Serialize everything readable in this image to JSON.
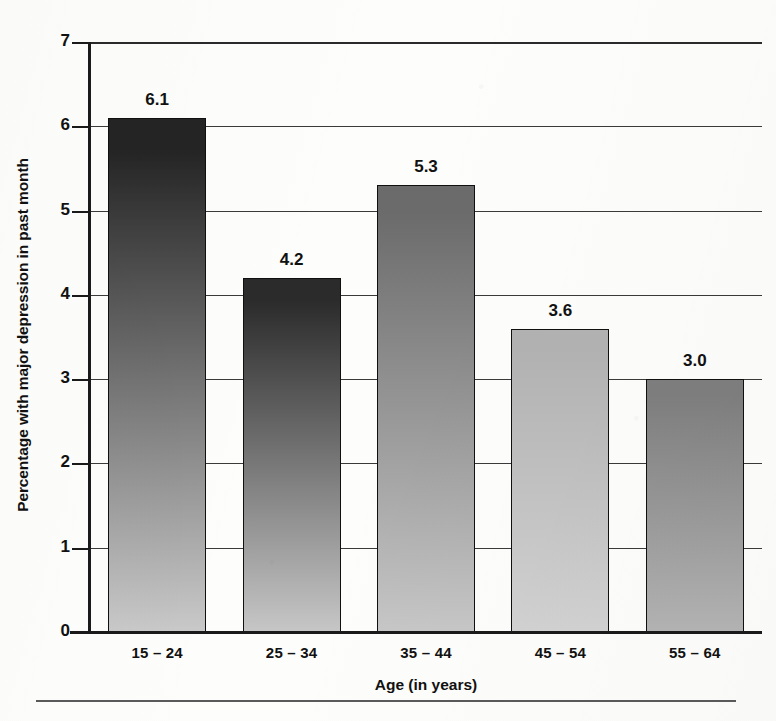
{
  "chart_data": {
    "type": "bar",
    "title": "",
    "subtitle": "",
    "xlabel": "Age (in years)",
    "ylabel": "Percentage with major depression in past month",
    "categories": [
      "15 – 24",
      "25 – 34",
      "35 – 44",
      "45 – 54",
      "55 – 64"
    ],
    "values": [
      6.1,
      4.2,
      5.3,
      3.6,
      3.0
    ],
    "value_labels": [
      "6.1",
      "4.2",
      "5.3",
      "3.6",
      "3.0"
    ],
    "ylim": [
      0,
      7
    ],
    "ytick_labels": [
      "0",
      "1",
      "2",
      "3",
      "4",
      "5",
      "6",
      "7"
    ],
    "ytick_values": [
      0,
      1,
      2,
      3,
      4,
      5,
      6,
      7
    ],
    "grid": true,
    "legend": "none",
    "bar_styles": [
      {
        "top": "#242424",
        "bottom": "#c9c9c9"
      },
      {
        "top": "#2b2b2b",
        "bottom": "#c6c6c6"
      },
      {
        "top": "#6b6b6b",
        "bottom": "#c7c7c7"
      },
      {
        "top": "#b2b2b2",
        "bottom": "#d2d2d2"
      },
      {
        "top": "#7e7e7e",
        "bottom": "#b4b4b4"
      }
    ]
  }
}
